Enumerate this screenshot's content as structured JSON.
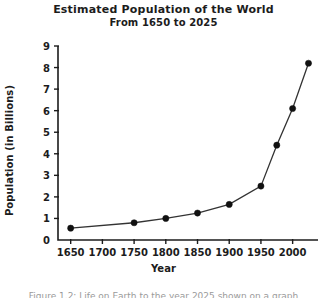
{
  "figure": {
    "background_color": "#ffffff",
    "ink_color": "#1c1c1c",
    "caption_partial": "Figure 1.2: Life on Earth to the year 2025 shown on a graph"
  },
  "chart_data": {
    "type": "line",
    "title": "Estimated Population of the World",
    "subtitle": "From 1650 to 2025",
    "xlabel": "Year",
    "ylabel": "Population (in Billions)",
    "grid": false,
    "legend": "none",
    "marker": "filled-circle",
    "marker_color": "#111111",
    "line_color": "#333333",
    "xlim": [
      1630,
      2040
    ],
    "ylim": [
      0,
      9
    ],
    "xticks": [
      1650,
      1700,
      1750,
      1800,
      1850,
      1900,
      1950,
      2000
    ],
    "xtick_labels": [
      "1650",
      "1700",
      "1750",
      "1800",
      "1850",
      "1900",
      "1950",
      "2000"
    ],
    "yticks": [
      0,
      1,
      2,
      3,
      4,
      5,
      6,
      7,
      8,
      9
    ],
    "ytick_labels": [
      "0",
      "1",
      "2",
      "3",
      "4",
      "5",
      "6",
      "7",
      "8",
      "9"
    ],
    "x": [
      1650,
      1750,
      1800,
      1850,
      1900,
      1950,
      1975,
      2000,
      2025
    ],
    "y": [
      0.55,
      0.8,
      1.0,
      1.25,
      1.65,
      2.5,
      4.4,
      6.1,
      8.2
    ],
    "series": [
      {
        "name": "World population",
        "points": [
          {
            "year": 1650,
            "population": 0.55
          },
          {
            "year": 1750,
            "population": 0.8
          },
          {
            "year": 1800,
            "population": 1.0
          },
          {
            "year": 1850,
            "population": 1.25
          },
          {
            "year": 1900,
            "population": 1.65
          },
          {
            "year": 1950,
            "population": 2.5
          },
          {
            "year": 1975,
            "population": 4.4
          },
          {
            "year": 2000,
            "population": 6.1
          },
          {
            "year": 2025,
            "population": 8.2
          }
        ]
      }
    ]
  }
}
